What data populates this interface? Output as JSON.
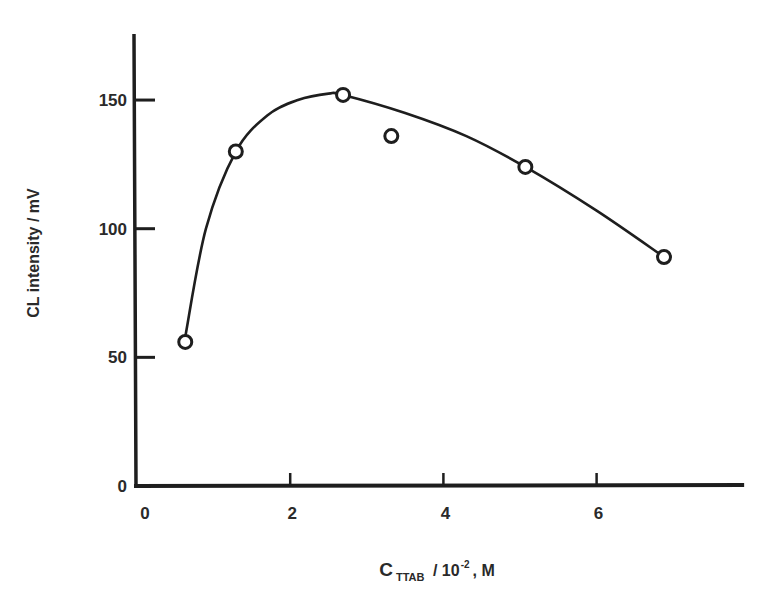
{
  "chart_data": {
    "type": "scatter",
    "title": "",
    "xlabel": {
      "main": "C",
      "subscript": "TTAB",
      "mid": " / 10",
      "superscript": "-2",
      "tail": ", M"
    },
    "ylabel": "CL intensity / mV",
    "xlim": [
      0,
      7.9
    ],
    "ylim": [
      0,
      175
    ],
    "xticks": [
      0,
      2,
      4,
      6
    ],
    "xtick_labels": [
      "0",
      "2",
      "4",
      "6"
    ],
    "yticks": [
      0,
      50,
      100,
      150
    ],
    "ytick_labels": [
      "0",
      "50",
      "100",
      "150"
    ],
    "grid": false,
    "legend": null,
    "series": [
      {
        "name": "measured",
        "marker": "open-circle",
        "x": [
          0.63,
          1.29,
          2.69,
          3.32,
          5.07,
          6.88
        ],
        "y": [
          56,
          130,
          152,
          136,
          124,
          89
        ]
      },
      {
        "name": "fitted curve",
        "style": "smooth-line",
        "x": [
          0.63,
          0.9,
          1.29,
          1.7,
          2.1,
          2.5,
          2.69,
          3.5,
          4.3,
          5.07,
          6.0,
          6.88
        ],
        "y": [
          58,
          100,
          130,
          144,
          150,
          152.5,
          152,
          145,
          136,
          124,
          107,
          89
        ]
      }
    ]
  },
  "colors": {
    "ink": "#1e1e1e",
    "background": "#ffffff"
  }
}
